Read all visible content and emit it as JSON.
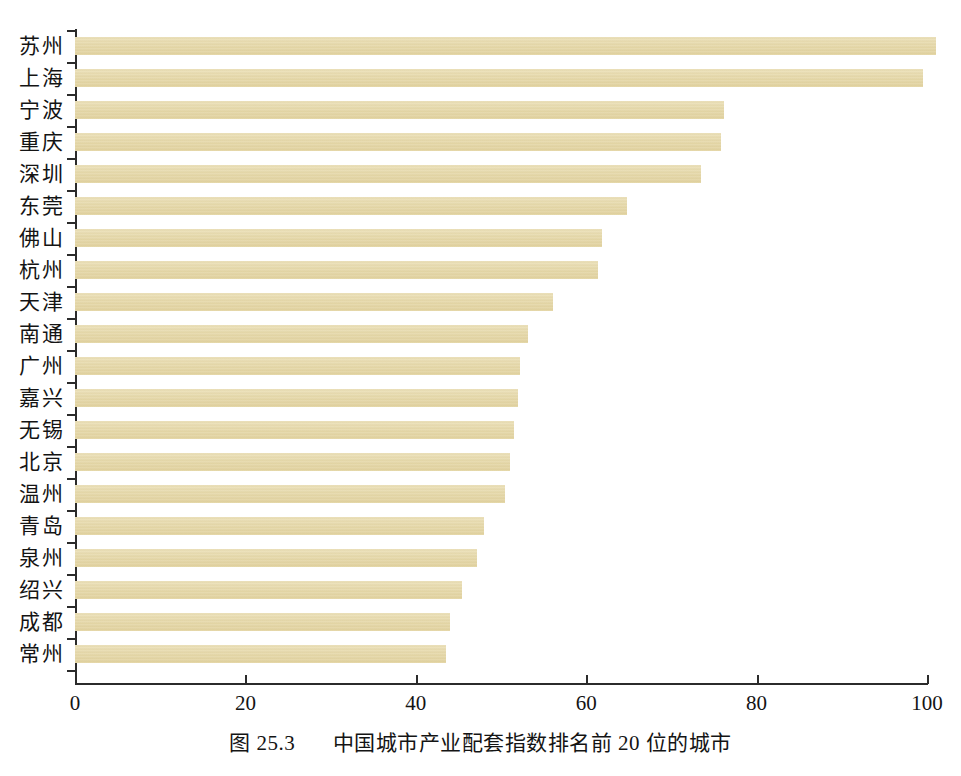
{
  "figure": {
    "caption_label": "图 25.3",
    "caption_text": "中国城市产业配套指数排名前 20 位的城市",
    "bar_color": "#e6d9ab",
    "axis_color": "#2b2b2b",
    "background_color": "#ffffff"
  },
  "chart_data": {
    "type": "bar",
    "orientation": "horizontal",
    "title": "图 25.3 中国城市产业配套指数排名前 20 位的城市",
    "xlabel": "",
    "ylabel": "",
    "xlim": [
      0,
      100
    ],
    "xticks": [
      0,
      20,
      40,
      60,
      80,
      100
    ],
    "xtick_labels": [
      "0",
      "20",
      "40",
      "60",
      "80",
      "100"
    ],
    "grid": false,
    "legend": false,
    "categories": [
      "苏州",
      "上海",
      "宁波",
      "重庆",
      "深圳",
      "东莞",
      "佛山",
      "杭州",
      "天津",
      "南通",
      "广州",
      "嘉兴",
      "无锡",
      "北京",
      "温州",
      "青岛",
      "泉州",
      "绍兴",
      "成都",
      "常州"
    ],
    "values": [
      101,
      99.5,
      76.2,
      75.8,
      73.5,
      64.8,
      61.9,
      61.4,
      56.1,
      53.2,
      52.2,
      52.0,
      51.5,
      51.1,
      50.5,
      48.0,
      47.2,
      45.4,
      44.0,
      43.5
    ],
    "series": [
      {
        "name": "产业配套指数",
        "values": [
          101,
          99.5,
          76.2,
          75.8,
          73.5,
          64.8,
          61.9,
          61.4,
          56.1,
          53.2,
          52.2,
          52.0,
          51.5,
          51.1,
          50.5,
          48.0,
          47.2,
          45.4,
          44.0,
          43.5
        ]
      }
    ]
  }
}
